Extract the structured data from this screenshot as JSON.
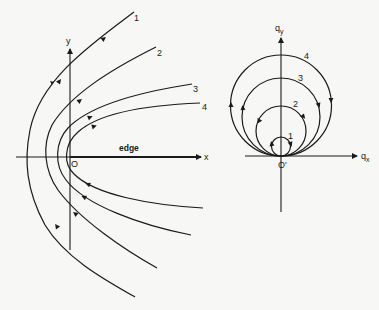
{
  "left_panel": {
    "x_axis_label": "x",
    "y_axis_label": "y",
    "origin_label": "O",
    "edge_label": "edge",
    "curves": [
      {
        "label": "1",
        "vertex": [
          27,
          157
        ],
        "upper_end": [
          134,
          12
        ],
        "lower_end": [
          135,
          297
        ]
      },
      {
        "label": "2",
        "vertex": [
          45,
          157
        ],
        "upper_end": [
          156,
          47
        ],
        "lower_end": [
          157,
          268
        ]
      },
      {
        "label": "3",
        "vertex": [
          57,
          157
        ],
        "upper_end": [
          192,
          84
        ],
        "lower_end": [
          191,
          235
        ]
      },
      {
        "label": "4",
        "vertex": [
          64,
          157
        ],
        "upper_end": [
          200,
          103
        ],
        "lower_end": [
          203,
          208
        ]
      }
    ]
  },
  "right_panel": {
    "x_axis_label": "q",
    "x_axis_sub": "x",
    "y_axis_label": "q",
    "y_axis_sub": "y",
    "origin_label": "O′",
    "circles": [
      {
        "label": "1",
        "radius": 9.5
      },
      {
        "label": "2",
        "radius": 25
      },
      {
        "label": "3",
        "radius": 39
      },
      {
        "label": "4",
        "radius": 50.5
      }
    ]
  },
  "colors": {
    "ink": "#1a1a1a",
    "background": "#f7f7f5"
  }
}
